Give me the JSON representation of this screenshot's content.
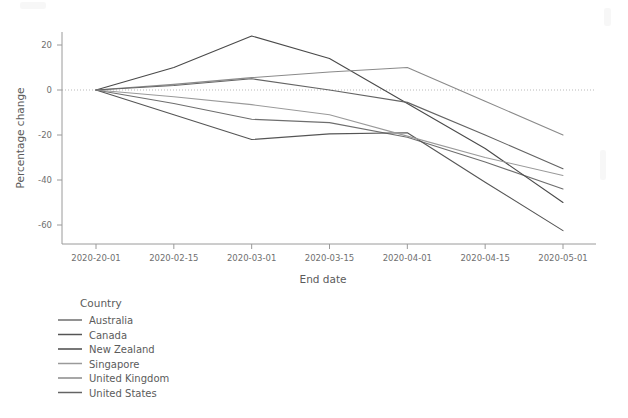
{
  "chart_data": {
    "type": "line",
    "title": "",
    "subtitle": "",
    "xlabel": "End date",
    "ylabel": "Percentage change",
    "x": [
      "2020-20-01",
      "2020-02-15",
      "2020-03-01",
      "2020-03-15",
      "2020-04-01",
      "2020-04-15",
      "2020-05-01"
    ],
    "xticklabels": [
      "2020-20-01",
      "2020-02-15",
      "2020-03-01",
      "2020-03-15",
      "2020-04-01",
      "2020-04-15",
      "2020-05-01"
    ],
    "yticklabels": [
      "20",
      "0",
      "-20",
      "-40",
      "-60"
    ],
    "yticks": [
      20,
      0,
      -20,
      -40,
      -60
    ],
    "ylim": [
      -70,
      28
    ],
    "grid": false,
    "zero_reference_line": true,
    "legend_title": "Country",
    "legend_position": "below-left",
    "series": [
      {
        "name": "Australia",
        "color": "#6e6e6e",
        "values": [
          0,
          -6.0,
          -13.0,
          -14.5,
          -21.0,
          -32.0,
          -44.0
        ]
      },
      {
        "name": "Canada",
        "color": "#555555",
        "values": [
          0,
          -11.0,
          -22.0,
          -19.5,
          -19.0,
          -41.0,
          -62.5
        ]
      },
      {
        "name": "New Zealand",
        "color": "#4a4a4a",
        "values": [
          0,
          10.0,
          24.0,
          14.0,
          -6.0,
          -26.0,
          -50.0
        ]
      },
      {
        "name": "Singapore",
        "color": "#9a9a9a",
        "values": [
          0,
          -3.0,
          -6.5,
          -11.0,
          -20.5,
          -30.0,
          -38.0
        ]
      },
      {
        "name": "United Kingdom",
        "color": "#8a8a8a",
        "values": [
          0,
          2.5,
          5.5,
          8.0,
          10.0,
          -5.0,
          -20.0
        ]
      },
      {
        "name": "United States",
        "color": "#646464",
        "values": [
          0,
          2.0,
          5.0,
          0.0,
          -5.5,
          -20.0,
          -35.0
        ]
      }
    ]
  },
  "axes": {
    "ylabel": "Percentage change",
    "xlabel": "End date"
  },
  "legend": {
    "title": "Country",
    "items": [
      {
        "label": "Australia"
      },
      {
        "label": "Canada"
      },
      {
        "label": "New Zealand"
      },
      {
        "label": "Singapore"
      },
      {
        "label": "United Kingdom"
      },
      {
        "label": "United States"
      }
    ]
  }
}
